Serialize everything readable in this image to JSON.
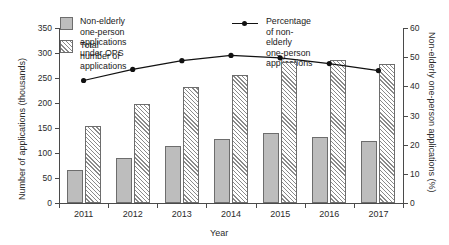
{
  "chart_data": {
    "type": "bar",
    "title": "",
    "xlabel": "Year",
    "ylabel": "Number of applications (thousands)",
    "y2label": "Non-elderly one-person applications (%)",
    "categories": [
      "2011",
      "2012",
      "2013",
      "2014",
      "2015",
      "2016",
      "2017"
    ],
    "ylim": [
      0,
      350
    ],
    "yticks": [
      0,
      50,
      100,
      150,
      200,
      250,
      300,
      350
    ],
    "y2lim": [
      0,
      60
    ],
    "y2ticks": [
      0,
      10,
      20,
      30,
      40,
      50,
      60
    ],
    "grid": false,
    "legend_position": "top",
    "series": [
      {
        "name": "Non-elderly one-person applications under OPS",
        "type": "bar",
        "style": "solid-gray",
        "axis": "left",
        "values": [
          66,
          91,
          114,
          129,
          140,
          132,
          125
        ]
      },
      {
        "name": "Total number of applications",
        "type": "bar",
        "style": "hatched",
        "axis": "left",
        "values": [
          155,
          199,
          233,
          256,
          283,
          286,
          279
        ]
      },
      {
        "name": "Percentage of non-elderly one-person applications",
        "type": "line",
        "style": "line-marker",
        "axis": "right",
        "values": [
          42.0,
          45.8,
          48.8,
          50.6,
          49.8,
          47.8,
          45.4
        ]
      }
    ]
  },
  "axes": {
    "left": {
      "title": "Number of applications (thousands)",
      "ticklabels": [
        "350",
        "300",
        "250",
        "200",
        "150",
        "100",
        "50",
        "0"
      ]
    },
    "right": {
      "title": "Non-elderly one-person applications (%)",
      "ticklabels": [
        "60",
        "50",
        "40",
        "30",
        "20",
        "10",
        "0"
      ]
    },
    "bottom": {
      "title": "Year",
      "ticklabels": [
        "2011",
        "2012",
        "2013",
        "2014",
        "2015",
        "2016",
        "2017"
      ]
    }
  },
  "legend": {
    "bar_solid": "Non-elderly one-person\napplications under OPS",
    "bar_hatch": "Total number of applications",
    "line": "Percentage of non-elderly\none-person applications"
  },
  "colors": {
    "bar_solid_fill": "#bdbdbd",
    "bar_edge": "#6d6d6d",
    "hatch_stroke": "#8a8a8a",
    "line": "#111111",
    "axis": "#4a4a4a",
    "text": "#1a1a1a",
    "background": "#ffffff"
  }
}
